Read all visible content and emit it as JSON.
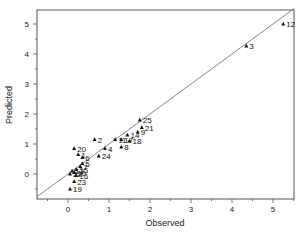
{
  "chart_data": {
    "type": "scatter",
    "title": "",
    "xlabel": "Observed",
    "ylabel": "Predicted",
    "xlim": [
      -0.75,
      5.5
    ],
    "ylim": [
      -0.85,
      5.45
    ],
    "xticks": [
      0,
      1,
      2,
      3,
      4,
      5
    ],
    "yticks": [
      0,
      1,
      2,
      3,
      4,
      5
    ],
    "grid": false,
    "legend": null,
    "marker": "triangle",
    "reference_line": {
      "type": "identity",
      "from": [
        -0.75,
        -0.75
      ],
      "to": [
        5.5,
        5.5
      ]
    },
    "points": [
      {
        "label": "12",
        "x": 5.25,
        "y": 5.0
      },
      {
        "label": "3",
        "x": 4.35,
        "y": 4.27
      },
      {
        "label": "25",
        "x": 1.75,
        "y": 1.8
      },
      {
        "label": "21",
        "x": 1.8,
        "y": 1.55
      },
      {
        "label": "9",
        "x": 1.7,
        "y": 1.4
      },
      {
        "label": "14",
        "x": 1.45,
        "y": 1.3
      },
      {
        "label": "18",
        "x": 1.5,
        "y": 1.1
      },
      {
        "label": "17",
        "x": 1.3,
        "y": 1.15
      },
      {
        "label": "11",
        "x": 1.15,
        "y": 1.15
      },
      {
        "label": "8",
        "x": 1.3,
        "y": 0.9
      },
      {
        "label": "2",
        "x": 0.65,
        "y": 1.15
      },
      {
        "label": "4",
        "x": 0.9,
        "y": 0.85
      },
      {
        "label": "24",
        "x": 0.75,
        "y": 0.6
      },
      {
        "label": "20",
        "x": 0.15,
        "y": 0.85
      },
      {
        "label": "1",
        "x": 0.25,
        "y": 0.65
      },
      {
        "label": "6",
        "x": 0.35,
        "y": 0.55
      },
      {
        "label": "5",
        "x": 0.35,
        "y": 0.35
      },
      {
        "label": "7",
        "x": 0.3,
        "y": 0.25
      },
      {
        "label": "15",
        "x": 0.2,
        "y": 0.15
      },
      {
        "label": "10",
        "x": 0.15,
        "y": 0.05
      },
      {
        "label": "13",
        "x": 0.1,
        "y": 0.1
      },
      {
        "label": "16",
        "x": 0.2,
        "y": -0.05
      },
      {
        "label": "22",
        "x": 0.05,
        "y": 0.0
      },
      {
        "label": "23",
        "x": 0.15,
        "y": -0.25
      },
      {
        "label": "19",
        "x": 0.05,
        "y": -0.5
      }
    ]
  }
}
